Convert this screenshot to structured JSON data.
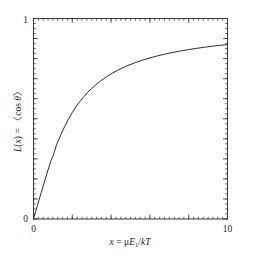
{
  "chart_data": {
    "type": "line",
    "title": "",
    "subtitle": "",
    "xlabel": "x = μE₁/kT",
    "ylabel": "L(x) = 〈cos θ〉",
    "xlim": [
      0,
      10
    ],
    "ylim": [
      0,
      1
    ],
    "grid": false,
    "legend": null,
    "legend_position": "none",
    "x_ticks_major": [
      0,
      2,
      4,
      6,
      8,
      10
    ],
    "x_tick_labels": [
      "0",
      "",
      "",
      "",
      "",
      "10"
    ],
    "x_minor_tick_step": 0.25,
    "y_ticks_major": [
      0,
      0.1,
      0.2,
      0.3,
      0.4,
      0.5,
      0.6,
      0.7,
      0.8,
      0.9,
      1.0
    ],
    "y_tick_labels": [
      "0",
      "",
      "",
      "",
      "",
      "",
      "",
      "",
      "",
      "",
      "1"
    ],
    "y_minor_tick_step": 0.025,
    "series": [
      {
        "name": "Langevin function L(x) = coth(x) - 1/x",
        "color": "#2b2b2b",
        "linewidth": 1,
        "x": [
          0,
          0.1,
          0.2,
          0.3,
          0.4,
          0.5,
          0.6,
          0.7,
          0.8,
          0.9,
          1.0,
          1.2,
          1.4,
          1.6,
          1.8,
          2.0,
          2.2,
          2.4,
          2.6,
          2.8,
          3.0,
          3.2,
          3.4,
          3.6,
          3.8,
          4.0,
          4.4,
          4.8,
          5.2,
          5.6,
          6.0,
          6.4,
          6.8,
          7.2,
          7.6,
          8.0,
          8.4,
          8.8,
          9.2,
          9.6,
          10.0
        ],
        "values": [
          0.0,
          0.0333,
          0.0666,
          0.0997,
          0.1325,
          0.1651,
          0.1973,
          0.2291,
          0.2603,
          0.291,
          0.313,
          0.373,
          0.4183,
          0.4599,
          0.4976,
          0.5312,
          0.5609,
          0.5874,
          0.6111,
          0.6323,
          0.6515,
          0.6688,
          0.6845,
          0.6988,
          0.7119,
          0.7239,
          0.7451,
          0.7631,
          0.7784,
          0.7918,
          0.8034,
          0.8137,
          0.8228,
          0.831,
          0.8383,
          0.845,
          0.851,
          0.8565,
          0.8615,
          0.8661,
          0.87
        ]
      }
    ]
  },
  "axis_labels": {
    "x_title_var": "x",
    "x_title_eq": "=",
    "x_title_mu": "μ",
    "x_title_E": "E",
    "x_title_E_sub": "1",
    "x_title_slash": "/",
    "x_title_k": "k",
    "x_title_T": "T",
    "y_title_L": "L",
    "y_title_open": "(",
    "y_title_x": "x",
    "y_title_close": ")",
    "y_title_eq": "=",
    "y_title_angle_open": "〈",
    "y_title_cos": "cos ",
    "y_title_theta": "θ",
    "y_title_angle_close": "〉",
    "x_min_label": "0",
    "x_max_label": "10",
    "y_min_label": "0",
    "y_max_label": "1"
  },
  "style": {
    "axis_color": "#3a3a3a",
    "curve_color": "#2b2b2b",
    "background": "#ffffff",
    "text_color": "#1a1a1a"
  }
}
